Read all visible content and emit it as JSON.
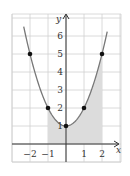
{
  "chart_data": {
    "type": "line",
    "title": "",
    "function": "y = x^2 + 1",
    "xlabel": "x",
    "ylabel": "y",
    "xlim": [
      -2.6,
      3.0
    ],
    "ylim": [
      -1.0,
      7.0
    ],
    "grid": true,
    "x_ticks": [
      -2,
      -1,
      1,
      2
    ],
    "y_ticks": [
      1,
      2,
      3,
      4,
      5,
      6
    ],
    "x_tick_labels": [
      "−2",
      "−1",
      "1",
      "2"
    ],
    "y_tick_labels": [
      "1",
      "2",
      "3",
      "4",
      "5",
      "6"
    ],
    "points": [
      {
        "x": -2,
        "y": 5
      },
      {
        "x": -1,
        "y": 2
      },
      {
        "x": 0,
        "y": 1
      },
      {
        "x": 1,
        "y": 2
      },
      {
        "x": 2,
        "y": 5
      }
    ],
    "shaded_region": {
      "x_from": -1,
      "x_to": 2,
      "under": "curve",
      "color": "#d9d9d9"
    },
    "colors": {
      "curve": "#777777",
      "grid": "#d0d0d0",
      "axis": "#333333",
      "point": "#111111",
      "shade": "#dcdcdc"
    }
  }
}
